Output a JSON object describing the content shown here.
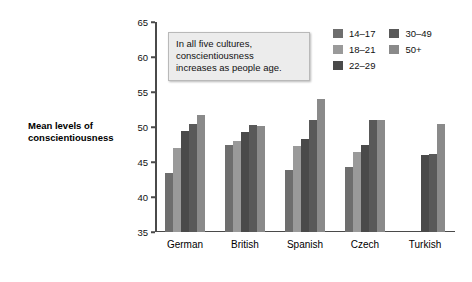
{
  "axis_title": "Mean levels of conscientiousness",
  "annotation": {
    "line1": "In all five cultures,",
    "line2": "conscientiousness",
    "line3": "increases as people age."
  },
  "legend": {
    "col1": [
      {
        "label": "14–17",
        "color": "#6e6e6e"
      },
      {
        "label": "18–21",
        "color": "#9a9a9a"
      },
      {
        "label": "22–29",
        "color": "#4a4a4a"
      }
    ],
    "col2": [
      {
        "label": "30–49",
        "color": "#595959"
      },
      {
        "label": "50+",
        "color": "#8a8a8a"
      }
    ]
  },
  "chart_data": {
    "type": "bar",
    "title": "",
    "xlabel": "",
    "ylabel": "Mean levels of conscientiousness",
    "ylim": [
      35,
      65
    ],
    "yticks": [
      35,
      40,
      45,
      50,
      55,
      60,
      65
    ],
    "grid": false,
    "legend_position": "top-right",
    "categories": [
      "German",
      "British",
      "Spanish",
      "Czech",
      "Turkish"
    ],
    "series": [
      {
        "name": "14–17",
        "color": "#6e6e6e",
        "values": [
          43.5,
          47.5,
          43.8,
          44.3,
          null
        ]
      },
      {
        "name": "18–21",
        "color": "#9a9a9a",
        "values": [
          47.0,
          48.0,
          47.3,
          46.5,
          null
        ]
      },
      {
        "name": "22–29",
        "color": "#4a4a4a",
        "values": [
          49.5,
          49.3,
          48.3,
          47.5,
          46.0
        ]
      },
      {
        "name": "30–49",
        "color": "#595959",
        "values": [
          50.5,
          50.3,
          51.0,
          51.0,
          46.2
        ]
      },
      {
        "name": "50+",
        "color": "#8a8a8a",
        "values": [
          51.7,
          50.1,
          54.0,
          51.0,
          50.5
        ]
      }
    ],
    "annotation_text": "In all five cultures, conscientiousness increases as people age."
  }
}
